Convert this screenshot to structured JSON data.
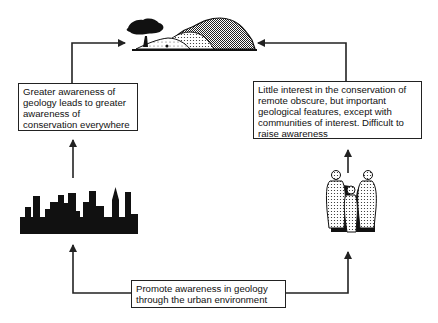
{
  "diagram": {
    "type": "cycle-flow",
    "nodes": {
      "landscape": {
        "label": "",
        "icon": "hill-with-tree-icon"
      },
      "left_box": {
        "lines": [
          "Greater awareness of",
          "geology leads to greater",
          "awareness of",
          "conservation everywhere"
        ]
      },
      "right_box": {
        "lines": [
          "Little interest in the conservation of",
          "remote obscure, but important",
          "geological features, except with",
          "communities of interest. Difficult to",
          "raise awareness"
        ]
      },
      "city": {
        "label": "",
        "icon": "city-skyline-icon"
      },
      "people": {
        "label": "",
        "icon": "people-group-icon"
      },
      "bottom_box": {
        "lines": [
          "Promote awareness in geology",
          "through the urban environment"
        ]
      }
    },
    "edges": [
      {
        "from": "bottom_box",
        "to": "city"
      },
      {
        "from": "city",
        "to": "left_box"
      },
      {
        "from": "left_box",
        "to": "landscape"
      },
      {
        "from": "bottom_box",
        "to": "people"
      },
      {
        "from": "people",
        "to": "right_box"
      },
      {
        "from": "right_box",
        "to": "landscape"
      }
    ],
    "colors": {
      "line": "#222222",
      "fill": "#111111",
      "background": "#ffffff"
    }
  }
}
